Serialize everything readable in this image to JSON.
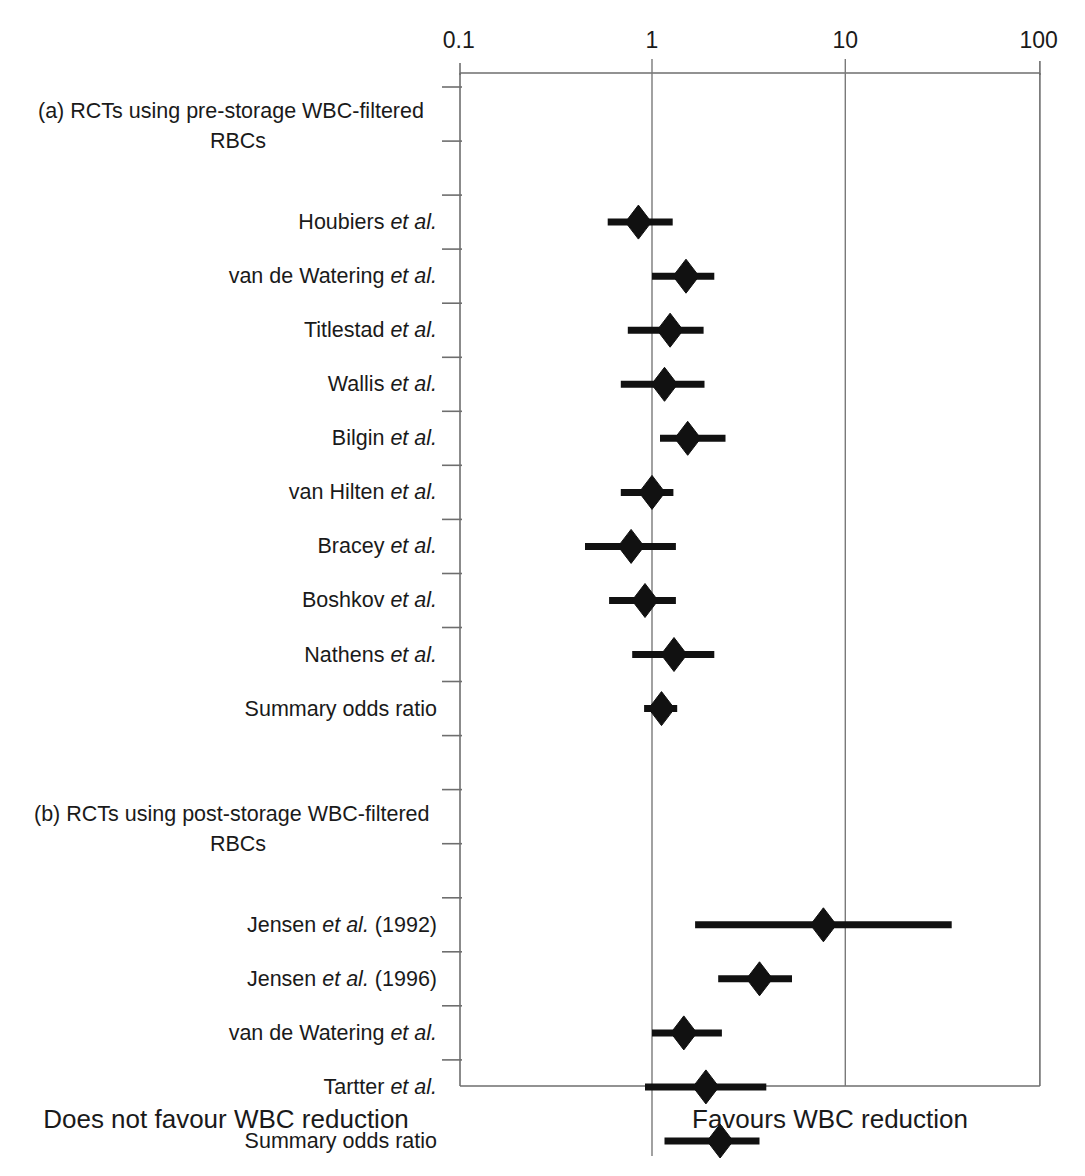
{
  "figure": {
    "title": "",
    "x_axis": {
      "scale": "log10",
      "tick_labels": [
        "0.1",
        "1",
        "10",
        "100"
      ],
      "tick_values": [
        0.1,
        1,
        10,
        100
      ],
      "range": [
        0.1,
        100
      ]
    },
    "footer_left": "Does not favour WBC reduction",
    "footer_right": "Favours WBC reduction",
    "reference_line": 1
  },
  "chart_data": {
    "type": "scatter",
    "title": "",
    "xlabel": "Odds ratio",
    "ylabel": "",
    "xlim": [
      0.1,
      100
    ],
    "xscale": "log",
    "grid": false,
    "legend": "none",
    "annotations": [
      "Does not favour WBC reduction",
      "Favours WBC reduction"
    ],
    "groups": [
      {
        "id": "a",
        "label_line1": "(a) RCTs using pre-storage WBC-filtered",
        "label_line2": "RBCs",
        "rows": [
          {
            "label": "Houbiers",
            "suffix": "et al.",
            "italic": true,
            "or": 0.85,
            "ci_low": 0.59,
            "ci_high": 1.28,
            "summary": false
          },
          {
            "label": "van de Watering",
            "suffix": "et al.",
            "italic": true,
            "or": 1.5,
            "ci_low": 1.0,
            "ci_high": 2.1,
            "summary": false
          },
          {
            "label": "Titlestad",
            "suffix": "et al.",
            "italic": true,
            "or": 1.24,
            "ci_low": 0.75,
            "ci_high": 1.85,
            "summary": false
          },
          {
            "label": "Wallis",
            "suffix": "et al.",
            "italic": true,
            "or": 1.16,
            "ci_low": 0.69,
            "ci_high": 1.87,
            "summary": false
          },
          {
            "label": "Bilgin",
            "suffix": "et al.",
            "italic": true,
            "or": 1.53,
            "ci_low": 1.1,
            "ci_high": 2.4,
            "summary": false
          },
          {
            "label": "van Hilten",
            "suffix": "et al.",
            "italic": true,
            "or": 1.0,
            "ci_low": 0.69,
            "ci_high": 1.29,
            "summary": false
          },
          {
            "label": "Bracey",
            "suffix": "et al.",
            "italic": true,
            "or": 0.78,
            "ci_low": 0.45,
            "ci_high": 1.33,
            "summary": false
          },
          {
            "label": "Boshkov",
            "suffix": "et al.",
            "italic": true,
            "or": 0.92,
            "ci_low": 0.6,
            "ci_high": 1.33,
            "summary": false
          },
          {
            "label": "Nathens",
            "suffix": "et al.",
            "italic": true,
            "or": 1.3,
            "ci_low": 0.79,
            "ci_high": 2.1,
            "summary": false
          },
          {
            "label": "Summary odds ratio",
            "suffix": "",
            "italic": false,
            "or": 1.12,
            "ci_low": 0.91,
            "ci_high": 1.35,
            "summary": true
          }
        ]
      },
      {
        "id": "b",
        "label_line1": "(b) RCTs using post-storage WBC-filtered",
        "label_line2": "RBCs",
        "rows": [
          {
            "label": "Jensen",
            "suffix": "et al. (1992)",
            "italic": true,
            "or": 7.7,
            "ci_low": 1.67,
            "ci_high": 35.5,
            "summary": false
          },
          {
            "label": "Jensen",
            "suffix": "et al. (1996)",
            "italic": true,
            "or": 3.6,
            "ci_low": 2.2,
            "ci_high": 5.3,
            "summary": false
          },
          {
            "label": "van de Watering",
            "suffix": "et al.",
            "italic": true,
            "or": 1.46,
            "ci_low": 1.0,
            "ci_high": 2.3,
            "summary": false
          },
          {
            "label": "Tartter",
            "suffix": "et al.",
            "italic": true,
            "or": 1.9,
            "ci_low": 0.92,
            "ci_high": 3.9,
            "summary": false
          },
          {
            "label": "Summary odds ratio",
            "suffix": "",
            "italic": false,
            "or": 2.25,
            "ci_low": 1.16,
            "ci_high": 3.6,
            "summary": true
          }
        ]
      }
    ]
  }
}
